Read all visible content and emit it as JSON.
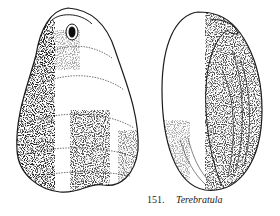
{
  "figure": {
    "number": "151.",
    "name": "Terebratula",
    "views": [
      "dorsal-view",
      "lateral-view"
    ],
    "ink_color": "#1a1a1a",
    "background": "#ffffff"
  }
}
